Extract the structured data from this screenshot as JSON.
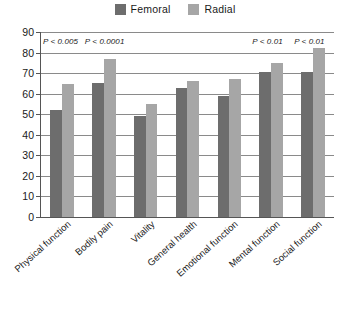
{
  "chart_data": {
    "type": "bar",
    "title": "",
    "subtitle": "",
    "xlabel": "",
    "ylabel": "",
    "ylim": [
      0,
      90
    ],
    "ytick_step": 10,
    "yticks": [
      0,
      10,
      20,
      30,
      40,
      50,
      60,
      70,
      80,
      90
    ],
    "grid": true,
    "legend_position": "top-center",
    "categories": [
      "Physical function",
      "Bodily pain",
      "Vitality",
      "General health",
      "Emotional function",
      "Mental function",
      "Social function"
    ],
    "series": [
      {
        "name": "Femoral",
        "color": "#6d6d6d",
        "values": [
          52,
          65,
          49,
          63,
          59,
          70.5,
          70.5
        ]
      },
      {
        "name": "Radial",
        "color": "#a6a6a6",
        "values": [
          64.5,
          77,
          55,
          66,
          67,
          75,
          82
        ]
      }
    ],
    "annotations": [
      {
        "text": "P < 0.005",
        "category": "Physical function"
      },
      {
        "text": "P < 0.0001",
        "category": "Bodily pain"
      },
      {
        "text": "P < 0.01",
        "category": "Mental function"
      },
      {
        "text": "P < 0.01",
        "category": "Social function"
      }
    ]
  },
  "legend": {
    "items": [
      {
        "label": "Femoral",
        "color": "#6d6d6d"
      },
      {
        "label": "Radial",
        "color": "#a6a6a6"
      }
    ]
  },
  "colors": {
    "femoral": "#6d6d6d",
    "radial": "#a6a6a6",
    "axis": "#555555",
    "grid": "#8a8a8a",
    "background": "#ffffff"
  }
}
